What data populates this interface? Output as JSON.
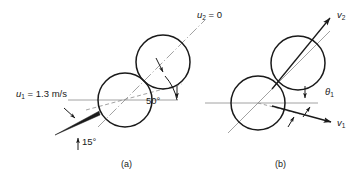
{
  "figure": {
    "title_alt": "Elastic collision of two balls: before and after impact",
    "background_color": "#ffffff",
    "stroke_color": "#1a1a1a",
    "centerline_color": "#8a8a8a",
    "width": 356,
    "height": 177
  },
  "panels": [
    {
      "id": "a",
      "caption": "(a)",
      "caption_pos": {
        "x": 121,
        "y": 167
      },
      "circles": [
        {
          "name": "ball-1-before",
          "cx": 125,
          "cy": 100,
          "r": 27
        },
        {
          "name": "ball-2-before",
          "cx": 163,
          "cy": 62,
          "r": 27
        }
      ],
      "labels": [
        {
          "name": "u1-label",
          "text": "u",
          "sub": "1",
          "rest": " = 1.3 m/s",
          "x": 16,
          "y": 97
        },
        {
          "name": "u2-label",
          "text": "u",
          "sub": "2",
          "rest": " = 0",
          "x": 197,
          "y": 18
        },
        {
          "name": "angle-50-label",
          "text": "50°",
          "x": 146,
          "y": 104
        },
        {
          "name": "angle-15-label",
          "text": "15°",
          "x": 82,
          "y": 145
        }
      ],
      "angles": {
        "incidence_deg": 15,
        "line_of_centers_deg": 50
      },
      "horizontal_axis": {
        "x1": 68,
        "x2": 178,
        "y": 100
      }
    },
    {
      "id": "b",
      "caption": "(b)",
      "caption_pos": {
        "x": 275,
        "y": 167
      },
      "circles": [
        {
          "name": "ball-1-after",
          "cx": 258,
          "cy": 103,
          "r": 27
        },
        {
          "name": "ball-2-after",
          "cx": 298,
          "cy": 63,
          "r": 27
        }
      ],
      "labels": [
        {
          "name": "v2-label",
          "text": "v",
          "sub": "2",
          "rest": "",
          "x": 337,
          "y": 18
        },
        {
          "name": "v1-label",
          "text": "v",
          "sub": "1",
          "rest": "",
          "x": 337,
          "y": 126
        },
        {
          "name": "theta1-label",
          "text": "θ",
          "sub": "1",
          "rest": "",
          "x": 325,
          "y": 95
        }
      ],
      "horizontal_axis": {
        "x1": 205,
        "x2": 318,
        "y": 103
      }
    }
  ]
}
